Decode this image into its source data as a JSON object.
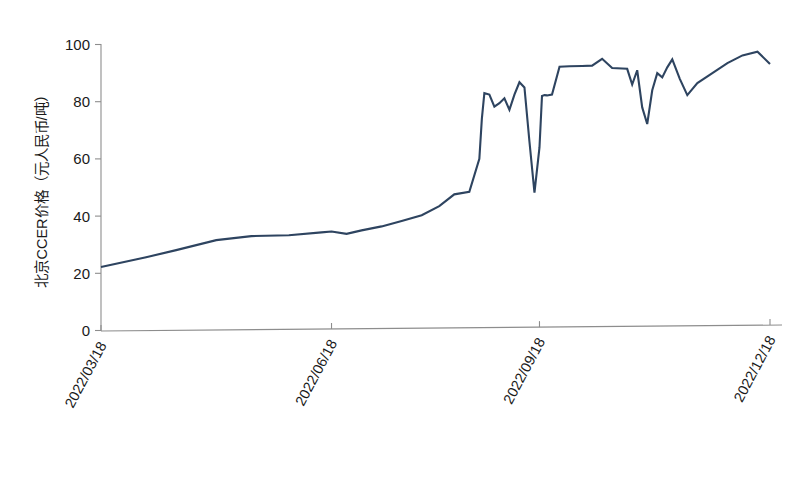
{
  "chart_data": {
    "type": "line",
    "title": "",
    "xlabel": "",
    "ylabel": "北京CCER价格（元人民币/吨）",
    "ylim": [
      0,
      100
    ],
    "yticks": [
      0,
      20,
      40,
      60,
      80,
      100
    ],
    "ytick_labels": [
      "0",
      "20",
      "40",
      "60",
      "80",
      "100"
    ],
    "xtick_labels": [
      "2022/03/18",
      "2022/06/18",
      "2022/09/18",
      "2022/12/18"
    ],
    "xtick_positions": [
      0,
      92,
      175,
      267
    ],
    "grid": false,
    "legend": null,
    "series_color": "#2e4460",
    "series": [
      {
        "name": "北京CCER价格",
        "x": [
          0,
          18,
          30,
          46,
          60,
          75,
          88,
          92,
          98,
          104,
          112,
          120,
          128,
          135,
          141,
          147,
          151,
          152,
          153,
          155,
          157,
          159,
          161,
          163,
          165,
          167,
          169,
          171,
          173,
          175,
          176,
          177,
          178,
          180,
          183,
          187,
          192,
          196,
          200,
          204,
          208,
          210,
          212,
          214,
          216,
          218,
          220,
          222,
          224,
          226,
          228,
          231,
          234,
          238,
          244,
          250,
          256,
          262,
          267
        ],
        "y": [
          22.2,
          25.6,
          28.1,
          31.6,
          33.0,
          33.3,
          34.3,
          34.6,
          33.8,
          35.0,
          36.4,
          38.3,
          40.3,
          43.5,
          47.6,
          48.5,
          60.0,
          74.0,
          83.0,
          82.5,
          78.3,
          79.5,
          81.2,
          77.2,
          82.5,
          86.8,
          85.0,
          66.0,
          48.2,
          64.0,
          82.0,
          82.3,
          82.2,
          82.5,
          92.2,
          92.4,
          92.5,
          92.6,
          95.0,
          91.8,
          91.6,
          91.5,
          86.0,
          91.0,
          78.0,
          72.2,
          84.0,
          90.0,
          88.5,
          92.0,
          94.8,
          88.0,
          82.3,
          86.5,
          90.0,
          93.5,
          96.2,
          97.5,
          93.2
        ]
      }
    ]
  },
  "axes": {
    "y_axis_name": "y-axis",
    "x_axis_name": "x-axis"
  }
}
